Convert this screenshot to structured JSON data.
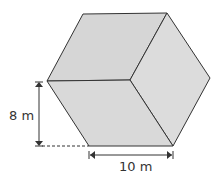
{
  "figure": {
    "shape": "hexagonal prism (isometric cube-like view)",
    "face_color": "#d9d9d9",
    "edge_color": "#333333",
    "vertices": {
      "top_left": [
        83,
        14
      ],
      "top_right": [
        167,
        13
      ],
      "right": [
        210,
        78
      ],
      "bottom_right": [
        173,
        146
      ],
      "bottom_left": [
        89,
        146
      ],
      "left": [
        47,
        81
      ],
      "center": [
        130,
        80
      ]
    }
  },
  "dimensions": {
    "height_label": "8 m",
    "width_label": "10 m"
  }
}
